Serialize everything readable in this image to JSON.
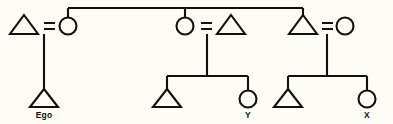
{
  "diagram": {
    "type": "genealogy-kinship-diagram",
    "background_color": "#fdfdf6",
    "ink_color": "#12100c",
    "labels": {
      "ego": "Ego",
      "person_y": "Y",
      "person_x": "X"
    },
    "symbols": {
      "male": "triangle",
      "female": "circle",
      "marriage": "equals-sign",
      "descent": "vertical-line",
      "sibling": "horizontal-bar"
    },
    "generations": [
      {
        "name": "parental-generation",
        "couples": [
          {
            "id": "couple-left",
            "male": {
              "shape": "triangle",
              "cx": 24,
              "cy": 26
            },
            "female": {
              "shape": "circle",
              "cx": 68,
              "cy": 26
            },
            "marriage_sign": "=",
            "children": [
              "Ego"
            ]
          },
          {
            "id": "couple-middle",
            "female": {
              "shape": "circle",
              "cx": 185,
              "cy": 26
            },
            "male": {
              "shape": "triangle",
              "cx": 231,
              "cy": 26
            },
            "marriage_sign": "=",
            "children": [
              "",
              "Y"
            ]
          },
          {
            "id": "couple-right",
            "male": {
              "shape": "triangle",
              "cx": 303,
              "cy": 26
            },
            "female": {
              "shape": "circle",
              "cx": 345,
              "cy": 26
            },
            "marriage_sign": "=",
            "children": [
              "",
              "X"
            ]
          }
        ]
      },
      {
        "name": "ego-generation",
        "members": [
          {
            "label": "Ego",
            "shape": "triangle",
            "cx": 44,
            "cy": 99,
            "parent_couple": "couple-left"
          },
          {
            "label": "",
            "shape": "triangle",
            "cx": 167,
            "cy": 99,
            "parent_couple": "couple-middle"
          },
          {
            "label": "Y",
            "shape": "circle",
            "cx": 248,
            "cy": 99,
            "parent_couple": "couple-middle"
          },
          {
            "label": "",
            "shape": "triangle",
            "cx": 288,
            "cy": 99,
            "parent_couple": "couple-right"
          },
          {
            "label": "X",
            "shape": "circle",
            "cx": 367,
            "cy": 99,
            "parent_couple": "couple-right"
          }
        ]
      }
    ],
    "sibling_bar_top": {
      "y": 8,
      "x_start": 68,
      "x_end": 303,
      "drops": [
        68,
        185,
        303
      ]
    }
  }
}
